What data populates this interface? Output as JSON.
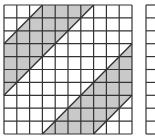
{
  "diagram": {
    "type": "grid-with-shaded-parallelograms",
    "grid": {
      "rows": 10,
      "cols": 10
    },
    "colors": {
      "shade": "#c9c9c9",
      "line": "#333333",
      "background": "#ffffff"
    },
    "shapes": [
      {
        "name": "top-left-parallelogram",
        "vertices_cells": [
          [
            3,
            0
          ],
          [
            7,
            0
          ],
          [
            0,
            7
          ],
          [
            0,
            3
          ]
        ]
      },
      {
        "name": "bottom-right-parallelogram",
        "vertices_cells": [
          [
            10,
            3
          ],
          [
            10,
            7
          ],
          [
            7,
            10
          ],
          [
            3,
            10
          ]
        ]
      }
    ],
    "partial_grid": {
      "visible": true,
      "rows": 10
    }
  }
}
